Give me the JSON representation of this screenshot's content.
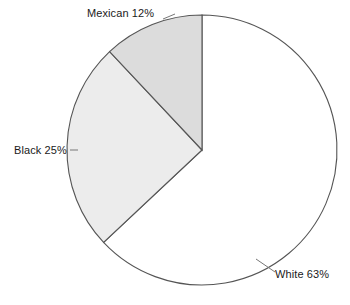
{
  "chart_data": {
    "type": "pie",
    "title": "",
    "categories": [
      "White",
      "Black",
      "Mexican"
    ],
    "values": [
      63,
      25,
      12
    ],
    "value_unit": "%",
    "slices": [
      {
        "label": "White",
        "value": 63,
        "label_text": "White 63%",
        "fill": "#ffffff",
        "stroke": "#555555",
        "start_angle_deg": 0,
        "end_angle_deg": 226.8,
        "has_leader_line": true
      },
      {
        "label": "Black",
        "value": 25,
        "label_text": "Black 25%",
        "fill": "#ececec",
        "stroke": "#555555",
        "start_angle_deg": 226.8,
        "end_angle_deg": 316.8,
        "has_leader_line": false
      },
      {
        "label": "Mexican",
        "value": 12,
        "label_text": "Mexican 12%",
        "fill": "#dcdcdc",
        "stroke": "#555555",
        "start_angle_deg": 316.8,
        "end_angle_deg": 360,
        "has_leader_line": false
      }
    ],
    "legend": "none",
    "legend_position": "labels-outside",
    "grid": false,
    "xlabel": "",
    "ylabel": "",
    "direction": "clockwise",
    "start_at": "12 o'clock",
    "total": 100,
    "geometry": {
      "center_x": 202,
      "center_y": 150,
      "radius": 135
    }
  },
  "colors": {
    "background": "#ffffff",
    "outline": "#555555",
    "text": "#1a1a1a",
    "leader": "#777777"
  }
}
